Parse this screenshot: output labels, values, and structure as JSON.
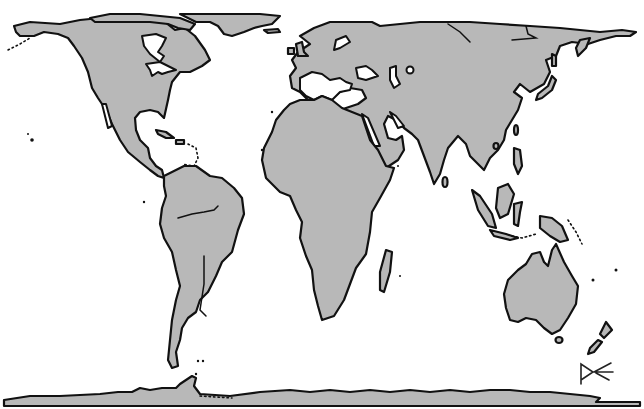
{
  "map": {
    "projection": "Gall-Peters equal-area",
    "style": "grayscale outline",
    "colors": {
      "land": "#b8b8b8",
      "coastline": "#111111",
      "ocean": "#ffffff"
    },
    "continents": [
      {
        "name": "North America"
      },
      {
        "name": "Greenland"
      },
      {
        "name": "South America"
      },
      {
        "name": "Europe"
      },
      {
        "name": "Africa"
      },
      {
        "name": "Asia"
      },
      {
        "name": "Australia"
      },
      {
        "name": "Antarctica"
      }
    ],
    "signature": "P⋜"
  }
}
